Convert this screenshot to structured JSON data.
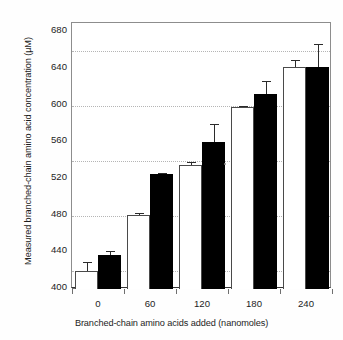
{
  "chart_data": {
    "type": "bar",
    "title": "",
    "xlabel": "Branched-chain amino acids added (nanomoles)",
    "ylabel": "Measured branched-chain amino acid concentration (µM)",
    "categories": [
      "0",
      "60",
      "120",
      "180",
      "240"
    ],
    "ylim": [
      400,
      690
    ],
    "ytick_labels": [
      "400",
      "440",
      "480",
      "520",
      "560",
      "600",
      "640",
      "680"
    ],
    "ytick_values": [
      400,
      440,
      480,
      520,
      560,
      600,
      640,
      680
    ],
    "gridlines": [
      420,
      480,
      540,
      600,
      660
    ],
    "grid": "horizontal-dotted",
    "legend": "none",
    "series": [
      {
        "name": "open-bar",
        "fill": "#ffffff",
        "values": [
          420,
          481,
          535,
          598,
          642
        ],
        "errors_upper": [
          429,
          483,
          538,
          600,
          650
        ],
        "errors_lower": [
          420,
          479,
          532,
          596,
          634
        ]
      },
      {
        "name": "filled-bar",
        "fill": "#000000",
        "values": [
          437,
          525,
          560,
          613,
          642
        ],
        "errors_upper": [
          441,
          526,
          580,
          627,
          667
        ],
        "errors_lower": [
          433,
          524,
          541,
          600,
          618
        ]
      }
    ]
  },
  "axes": {
    "y_title": "Measured branched-chain amino acid concentration (µM)",
    "x_title": "Branched-chain amino acids added (nanomoles)"
  }
}
